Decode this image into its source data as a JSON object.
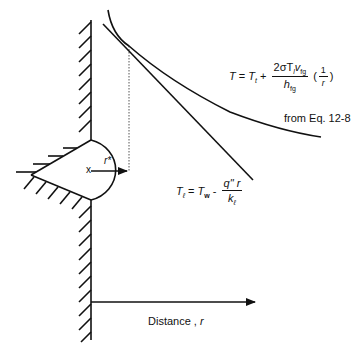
{
  "diagram": {
    "type": "boiling nucleation temperature profile",
    "curve_label": {
      "lhs": "T",
      "eq": "=",
      "t1": "T",
      "t1_sub": "t",
      "plus": "+",
      "numerator": "2σT",
      "numerator_sub1": "l",
      "numerator_v": "v",
      "numerator_sub2": "fg",
      "denominator": "h",
      "denominator_sub": "fg",
      "paren_num": "1",
      "paren_den": "r"
    },
    "curve_source": "from Eq. 12-8",
    "line_label": {
      "lhs": "T",
      "lhs_sub": "ℓ",
      "eq": "=",
      "tw": "T",
      "tw_sub": "w",
      "minus": "-",
      "numerator": "q\" r",
      "denominator": "k",
      "denominator_sub": "ℓ"
    },
    "radius_label": "r*",
    "center_marker": "x",
    "axis_label": "Distance ,",
    "axis_var": "r",
    "stroke_color": "#111111"
  }
}
